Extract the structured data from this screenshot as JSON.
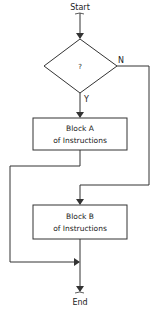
{
  "diagram": {
    "type": "flowchart",
    "start_label": "Start",
    "end_label": "End",
    "decision": {
      "label": "?",
      "yes_label": "Y",
      "no_label": "N"
    },
    "block_a": {
      "line1": "Block A",
      "line2": "of Instructions"
    },
    "block_b": {
      "line1": "Block B",
      "line2": "of Instructions"
    },
    "colors": {
      "stroke": "#333333",
      "text": "#222222",
      "background": "#ffffff"
    }
  }
}
